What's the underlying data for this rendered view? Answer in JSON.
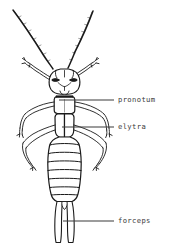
{
  "figure": {
    "view": "dorsal",
    "style": "line-drawing",
    "ink_color": "#1a1a1a",
    "label_color": "#3a3a3a",
    "background_color": "#ffffff",
    "canvas": {
      "width": 179,
      "height": 250
    }
  },
  "labels": [
    {
      "id": "pronotum",
      "text": "pronotum",
      "text_x": 118,
      "text_y": 100,
      "leader": {
        "x1": 59,
        "y1": 100,
        "x2": 114,
        "y2": 100
      }
    },
    {
      "id": "elytra",
      "text": "elytra",
      "text_x": 118,
      "text_y": 127,
      "leader": {
        "x1": 62,
        "y1": 127,
        "x2": 114,
        "y2": 127
      }
    },
    {
      "id": "forceps",
      "text": "forceps",
      "text_x": 118,
      "text_y": 221,
      "leader": {
        "x1": 63,
        "y1": 221,
        "x2": 114,
        "y2": 221
      }
    }
  ],
  "anatomy_parts": [
    "antenna-left",
    "antenna-right",
    "head",
    "eye-left",
    "eye-right",
    "mandibles",
    "pronotum",
    "elytra",
    "abdomen",
    "forceps-left",
    "forceps-right",
    "leg-fore-left",
    "leg-fore-right",
    "leg-mid-left",
    "leg-mid-right",
    "leg-hind-left",
    "leg-hind-right"
  ]
}
